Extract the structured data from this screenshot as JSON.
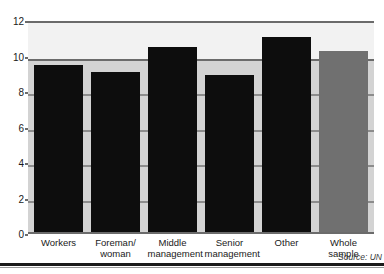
{
  "chart_data": {
    "type": "bar",
    "title": "",
    "xlabel": "",
    "ylabel": "",
    "categories": [
      "Workers",
      "Foreman/ woman",
      "Middle management",
      "Senior management",
      "Other",
      "Whole sample"
    ],
    "category_lines": [
      [
        "Workers"
      ],
      [
        "Foreman/",
        "woman"
      ],
      [
        "Middle",
        "management"
      ],
      [
        "Senior",
        "management"
      ],
      [
        "Other"
      ],
      [
        "Whole",
        "sample"
      ]
    ],
    "values": [
      9.6,
      9.2,
      10.6,
      9.0,
      11.2,
      10.4
    ],
    "bar_colors": [
      "#0d0d0d",
      "#0d0d0d",
      "#0d0d0d",
      "#0d0d0d",
      "#0d0d0d",
      "#707070"
    ],
    "ylim": [
      0,
      12
    ],
    "yticks": [
      0,
      2,
      4,
      6,
      8,
      10,
      12
    ],
    "ytick_labels": [
      "0",
      "2",
      "4",
      "6",
      "8",
      "10",
      "12"
    ],
    "grid": true,
    "legend": "none"
  },
  "footer": {
    "source": "Source: UN"
  },
  "colors": {
    "bar_dark": "#0d0d0d",
    "bar_light": "#707070",
    "plot_bg": "#d3d3d3",
    "plot_bg_top": "#f2f2f2",
    "gridline": "#6b6b6b"
  }
}
